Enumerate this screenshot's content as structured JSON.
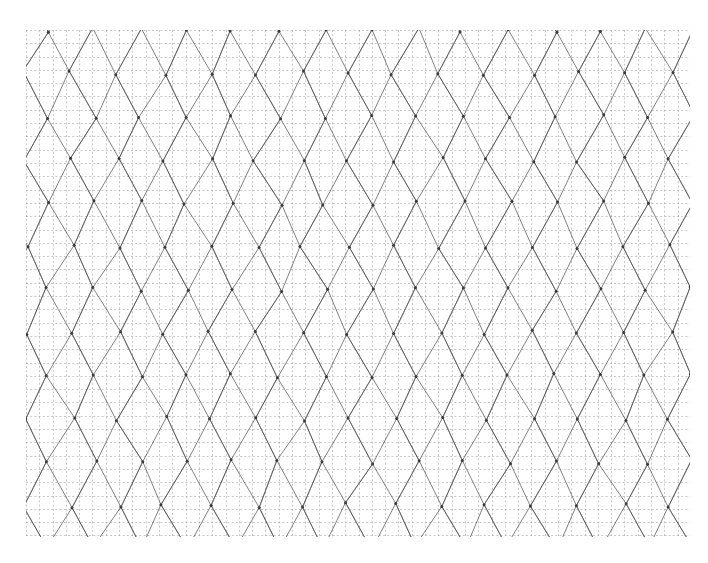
{
  "document": {
    "kind": "figure",
    "title": "Triangular lattice mesh over dashed square grid",
    "background_color": "#ffffff",
    "width": 708,
    "height": 563
  },
  "chart_data": {
    "type": "diagram",
    "subtype": "triangular-lattice-mesh",
    "title": "",
    "subtitle": "",
    "xlabel": "",
    "ylabel": "",
    "legend": [],
    "annotations": [],
    "grid": {
      "visible": true,
      "style": "dashed",
      "color": "#9a9a9a",
      "line_width": 0.7,
      "dash_pattern": [
        2,
        2.2
      ],
      "cell_size_px": 13.3,
      "columns": 50,
      "rows": 38,
      "opacity": 0.78
    },
    "plot_area": {
      "x": 26,
      "y": 30,
      "width": 664,
      "height": 507,
      "border": false
    },
    "mesh": {
      "color": "#555555",
      "line_width": 0.85,
      "opacity": 0.88,
      "jitter_amplitude_px": 3.2,
      "node_radius_px": 1.5,
      "node_color": "#3a3a3a",
      "families": [
        {
          "name": "near-vertical",
          "count": 15,
          "spacing_px": 46,
          "angle_deg": 87,
          "angle_jitter_deg": 7
        },
        {
          "name": "diagonal-down-right",
          "count": 22,
          "spacing_px": 46,
          "angle_deg": 28,
          "angle_jitter_deg": 4
        },
        {
          "name": "diagonal-up-right",
          "count": 22,
          "spacing_px": 46,
          "angle_deg": -28,
          "angle_jitter_deg": 4
        }
      ]
    },
    "axis": {
      "x_range": [
        0,
        50
      ],
      "y_range": [
        0,
        38
      ],
      "ticks_visible": false,
      "tick_labels": []
    },
    "colors": {
      "background": "#ffffff",
      "grid": "#9a9a9a",
      "mesh": "#555555",
      "node": "#3a3a3a"
    }
  }
}
